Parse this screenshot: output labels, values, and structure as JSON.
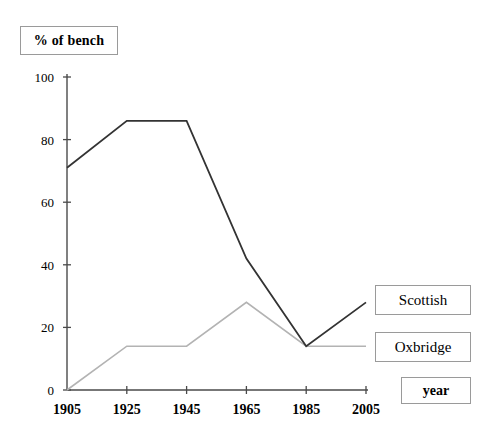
{
  "chart_data": {
    "type": "line",
    "title": "% of bench",
    "xlabel": "year",
    "ylabel": "% of bench",
    "x": [
      1905,
      1925,
      1945,
      1965,
      1985,
      2005
    ],
    "categories": [
      "1905",
      "1925",
      "1945",
      "1965",
      "1985",
      "2005"
    ],
    "xlim": [
      1905,
      2005
    ],
    "ylim": [
      0,
      100
    ],
    "yticks": [
      0,
      20,
      40,
      60,
      80,
      100
    ],
    "ytick_labels": [
      "0",
      "20",
      "40",
      "60",
      "80",
      "100"
    ],
    "xticks": [
      1905,
      1925,
      1945,
      1965,
      1985,
      2005
    ],
    "xtick_labels": [
      "1905",
      "1925",
      "1945",
      "1965",
      "1985",
      "2005"
    ],
    "grid": false,
    "legend_position": "right-of-line-ends",
    "series": [
      {
        "name": "Scottish",
        "color": "#333333",
        "values": [
          71,
          86,
          86,
          42,
          14,
          28
        ]
      },
      {
        "name": "Oxbridge",
        "color": "#b3b3b3",
        "values": [
          0,
          14,
          14,
          28,
          14,
          14
        ]
      }
    ]
  },
  "title_box": {
    "label": "% of bench"
  },
  "legend": {
    "scottish_label": "Scottish",
    "oxbridge_label": "Oxbridge"
  },
  "xaxis_box": {
    "label": "year"
  },
  "colors": {
    "scottish_line": "#333333",
    "oxbridge_line": "#b3b3b3",
    "axis": "#4a4a4a",
    "box_border": "#9a9a9a",
    "background": "#ffffff"
  }
}
